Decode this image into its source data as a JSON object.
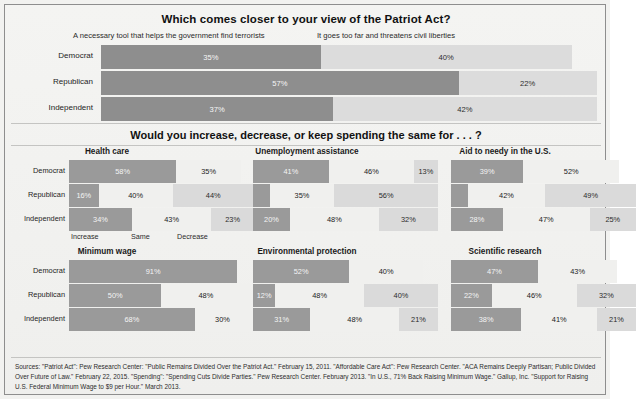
{
  "top": {
    "title": "Which comes closer to your view of the Patriot Act?",
    "legend_left": "A necessary tool that helps the government find terrorists",
    "legend_right": "It goes too far and threatens civil liberties",
    "rows": [
      {
        "label": "Democrat",
        "left_value": 35,
        "left_label": "35%",
        "right_value": 40,
        "right_label": "40%"
      },
      {
        "label": "Republican",
        "left_value": 57,
        "left_label": "57%",
        "right_value": 22,
        "right_label": "22%"
      },
      {
        "label": "Independent",
        "left_value": 37,
        "left_label": "37%",
        "right_value": 42,
        "right_label": "42%"
      }
    ]
  },
  "mid": {
    "title": "Would you increase, decrease, or keep spending the same for . . . ?",
    "axis": [
      "Increase",
      "Same",
      "Decrease"
    ],
    "party_labels": [
      "Democrat",
      "Republican",
      "Independent"
    ]
  },
  "panels": [
    {
      "title": "Health care",
      "rows": [
        {
          "party": "Democrat",
          "values": [
            58,
            35,
            0
          ],
          "labels": [
            "58%",
            "35%",
            ""
          ]
        },
        {
          "party": "Republican",
          "values": [
            16,
            40,
            44
          ],
          "labels": [
            "16%",
            "40%",
            "44%"
          ]
        },
        {
          "party": "Independent",
          "values": [
            34,
            43,
            23
          ],
          "labels": [
            "34%",
            "43%",
            "23%"
          ]
        }
      ]
    },
    {
      "title": "Unemployment assistance",
      "rows": [
        {
          "party": "Democrat",
          "values": [
            41,
            46,
            13
          ],
          "labels": [
            "41%",
            "46%",
            "13%"
          ]
        },
        {
          "party": "Republican",
          "values": [
            9,
            35,
            56
          ],
          "labels": [
            "",
            "35%",
            "56%"
          ]
        },
        {
          "party": "Independent",
          "values": [
            20,
            48,
            32
          ],
          "labels": [
            "20%",
            "48%",
            "32%"
          ]
        }
      ]
    },
    {
      "title": "Aid to needy in the U.S.",
      "rows": [
        {
          "party": "Democrat",
          "values": [
            39,
            52,
            0
          ],
          "labels": [
            "39%",
            "52%",
            ""
          ]
        },
        {
          "party": "Republican",
          "values": [
            9,
            42,
            49
          ],
          "labels": [
            "",
            "42%",
            "49%"
          ]
        },
        {
          "party": "Independent",
          "values": [
            28,
            47,
            25
          ],
          "labels": [
            "28%",
            "47%",
            "25%"
          ]
        }
      ]
    },
    {
      "title": "Minimum wage",
      "rows": [
        {
          "party": "Democrat",
          "values": [
            91,
            0,
            0
          ],
          "labels": [
            "91%",
            "",
            ""
          ]
        },
        {
          "party": "Republican",
          "values": [
            50,
            48,
            0
          ],
          "labels": [
            "50%",
            "48%",
            ""
          ]
        },
        {
          "party": "Independent",
          "values": [
            68,
            30,
            0
          ],
          "labels": [
            "68%",
            "30%",
            ""
          ]
        }
      ]
    },
    {
      "title": "Environmental protection",
      "rows": [
        {
          "party": "Democrat",
          "values": [
            52,
            40,
            0
          ],
          "labels": [
            "52%",
            "40%",
            ""
          ]
        },
        {
          "party": "Republican",
          "values": [
            12,
            48,
            40
          ],
          "labels": [
            "12%",
            "48%",
            "40%"
          ]
        },
        {
          "party": "Independent",
          "values": [
            31,
            48,
            21
          ],
          "labels": [
            "31%",
            "48%",
            "21%"
          ]
        }
      ]
    },
    {
      "title": "Scientific research",
      "rows": [
        {
          "party": "Democrat",
          "values": [
            47,
            43,
            0
          ],
          "labels": [
            "47%",
            "43%",
            ""
          ]
        },
        {
          "party": "Republican",
          "values": [
            22,
            46,
            32
          ],
          "labels": [
            "22%",
            "46%",
            "32%"
          ]
        },
        {
          "party": "Independent",
          "values": [
            38,
            41,
            21
          ],
          "labels": [
            "38%",
            "41%",
            "21%"
          ]
        }
      ]
    }
  ],
  "sources": "Sources: \"Patriot Act\": Pew Research Center: \"Public Remains Divided Over the Patriot Act.\" February 15, 2011. \"Affordable Care Act\": Pew Research Center. \"ACA Remains Deeply Partisan; Public Divided Over Future of Law.\" February 22, 2015. \"Spending\": \"Spending Cuts Divide Parties.\" Pew Research Center. February 2013. \"In U.S., 71% Back Raising Minimum Wage.\" Gallup, Inc. \"Support for Raising U.S. Federal Minimum Wage to $9 per Hour.\" March 2013.",
  "chart_data": [
    {
      "type": "bar",
      "title": "Which comes closer to your view of the Patriot Act?",
      "orientation": "horizontal-stacked",
      "categories": [
        "Democrat",
        "Republican",
        "Independent"
      ],
      "series": [
        {
          "name": "A necessary tool that helps the government find terrorists",
          "values": [
            35,
            57,
            37
          ],
          "color": "#8e8e8e"
        },
        {
          "name": "It goes too far and threatens civil liberties",
          "values": [
            40,
            22,
            42
          ],
          "color": "#dcdcdc"
        }
      ],
      "xlabel": "",
      "ylabel": "",
      "xlim": [
        0,
        100
      ],
      "grid": false,
      "legend": "top"
    },
    {
      "type": "bar",
      "title": "Health care",
      "orientation": "horizontal-stacked",
      "categories": [
        "Democrat",
        "Republican",
        "Independent"
      ],
      "series": [
        {
          "name": "Increase",
          "values": [
            58,
            16,
            34
          ]
        },
        {
          "name": "Same",
          "values": [
            35,
            40,
            43
          ]
        },
        {
          "name": "Decrease",
          "values": [
            null,
            44,
            23
          ]
        }
      ],
      "xlim": [
        0,
        100
      ],
      "grid": false
    },
    {
      "type": "bar",
      "title": "Unemployment assistance",
      "orientation": "horizontal-stacked",
      "categories": [
        "Democrat",
        "Republican",
        "Independent"
      ],
      "series": [
        {
          "name": "Increase",
          "values": [
            41,
            null,
            20
          ]
        },
        {
          "name": "Same",
          "values": [
            46,
            35,
            48
          ]
        },
        {
          "name": "Decrease",
          "values": [
            13,
            56,
            32
          ]
        }
      ],
      "xlim": [
        0,
        100
      ],
      "grid": false
    },
    {
      "type": "bar",
      "title": "Aid to needy in the U.S.",
      "orientation": "horizontal-stacked",
      "categories": [
        "Democrat",
        "Republican",
        "Independent"
      ],
      "series": [
        {
          "name": "Increase",
          "values": [
            39,
            null,
            28
          ]
        },
        {
          "name": "Same",
          "values": [
            52,
            42,
            47
          ]
        },
        {
          "name": "Decrease",
          "values": [
            null,
            49,
            25
          ]
        }
      ],
      "xlim": [
        0,
        100
      ],
      "grid": false
    },
    {
      "type": "bar",
      "title": "Minimum wage",
      "orientation": "horizontal-stacked",
      "categories": [
        "Democrat",
        "Republican",
        "Independent"
      ],
      "series": [
        {
          "name": "Increase",
          "values": [
            91,
            50,
            68
          ]
        },
        {
          "name": "Same",
          "values": [
            null,
            48,
            30
          ]
        },
        {
          "name": "Decrease",
          "values": [
            null,
            null,
            null
          ]
        }
      ],
      "xlim": [
        0,
        100
      ],
      "grid": false
    },
    {
      "type": "bar",
      "title": "Environmental protection",
      "orientation": "horizontal-stacked",
      "categories": [
        "Democrat",
        "Republican",
        "Independent"
      ],
      "series": [
        {
          "name": "Increase",
          "values": [
            52,
            12,
            31
          ]
        },
        {
          "name": "Same",
          "values": [
            40,
            48,
            48
          ]
        },
        {
          "name": "Decrease",
          "values": [
            null,
            40,
            21
          ]
        }
      ],
      "xlim": [
        0,
        100
      ],
      "grid": false
    },
    {
      "type": "bar",
      "title": "Scientific research",
      "orientation": "horizontal-stacked",
      "categories": [
        "Democrat",
        "Republican",
        "Independent"
      ],
      "series": [
        {
          "name": "Increase",
          "values": [
            47,
            22,
            38
          ]
        },
        {
          "name": "Same",
          "values": [
            43,
            46,
            41
          ]
        },
        {
          "name": "Decrease",
          "values": [
            null,
            32,
            21
          ]
        }
      ],
      "xlim": [
        0,
        100
      ],
      "grid": false
    }
  ]
}
